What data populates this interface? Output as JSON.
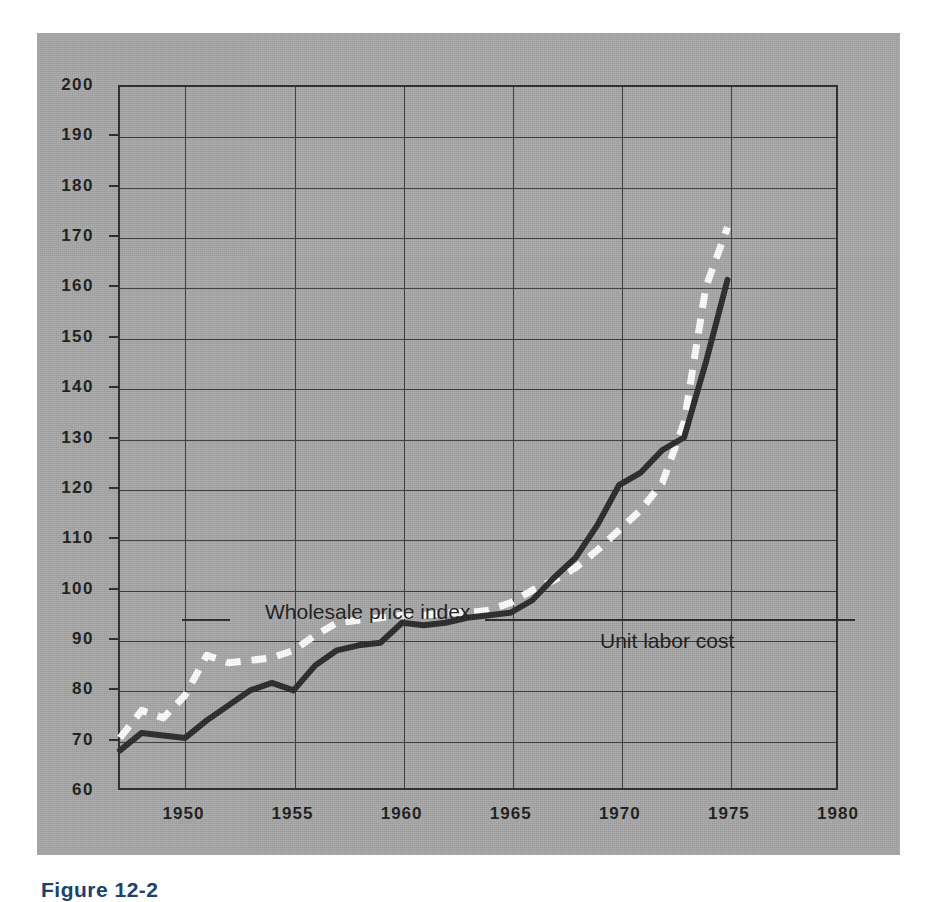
{
  "figure": {
    "caption": "Figure 12-2",
    "panel_color": "#a8a8a8",
    "caption_color": "#20416b"
  },
  "chart_data": {
    "type": "line",
    "title": "",
    "subtitle": "",
    "xlabel": "",
    "ylabel": "",
    "xlim": [
      1947,
      1980
    ],
    "ylim": [
      60,
      200
    ],
    "grid": true,
    "legend_position": "inline-annotation",
    "x_ticks": [
      1950,
      1955,
      1960,
      1965,
      1970,
      1975,
      1980
    ],
    "y_ticks": [
      60,
      70,
      80,
      90,
      100,
      110,
      120,
      130,
      140,
      150,
      160,
      170,
      180,
      190,
      200
    ],
    "annotations": [
      {
        "text": "Wholesale price index",
        "series": "Wholesale price index"
      },
      {
        "text": "Unit labor cost",
        "series": "Unit labor cost"
      }
    ],
    "series": [
      {
        "name": "Wholesale price index",
        "style": "dashed",
        "color": "#ffffff",
        "x": [
          1947,
          1948,
          1949,
          1950,
          1951,
          1952,
          1953,
          1954,
          1955,
          1956,
          1957,
          1958,
          1959,
          1960,
          1961,
          1962,
          1963,
          1964,
          1965,
          1966,
          1967,
          1968,
          1969,
          1970,
          1971,
          1972,
          1973,
          1974,
          1975
        ],
        "values": [
          70.0,
          75.5,
          74.0,
          78.5,
          86.5,
          85.0,
          85.5,
          86.0,
          87.5,
          90.5,
          93.0,
          93.5,
          94.0,
          94.5,
          94.5,
          95.0,
          95.0,
          95.5,
          97.0,
          99.5,
          101.5,
          104.0,
          107.5,
          111.5,
          115.5,
          121.0,
          133.0,
          160.0,
          172.0
        ]
      },
      {
        "name": "Unit labor cost",
        "style": "solid",
        "color": "#2b2b2b",
        "x": [
          1947,
          1948,
          1949,
          1950,
          1951,
          1952,
          1953,
          1954,
          1955,
          1956,
          1957,
          1958,
          1959,
          1960,
          1961,
          1962,
          1963,
          1964,
          1965,
          1966,
          1967,
          1968,
          1969,
          1970,
          1971,
          1972,
          1973,
          1974,
          1975
        ],
        "values": [
          67.5,
          71.0,
          70.5,
          70.0,
          73.5,
          76.5,
          79.5,
          81.0,
          79.5,
          84.5,
          87.5,
          88.5,
          89.0,
          93.0,
          92.5,
          93.0,
          94.0,
          94.5,
          95.0,
          97.5,
          102.0,
          106.0,
          112.5,
          120.5,
          123.0,
          127.5,
          130.0,
          145.0,
          161.5
        ]
      }
    ]
  }
}
